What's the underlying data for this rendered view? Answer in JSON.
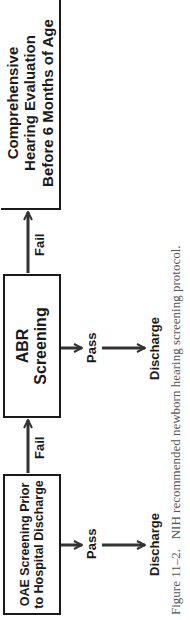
{
  "diagram": {
    "boxes": {
      "oae": {
        "line1": "OAE Screening Prior",
        "line2": "to Hospital Discharge"
      },
      "abr": {
        "line1": "ABR",
        "line2": "Screening"
      },
      "comprehensive": {
        "line1": "Comprehensive",
        "line2": "Hearing Evaluation",
        "line3": "Before 6 Months of Age"
      }
    },
    "edges": {
      "oae_fail": "Fail",
      "abr_fail": "Fail",
      "oae_pass": "Pass",
      "abr_pass": "Pass"
    },
    "outcomes": {
      "oae_discharge": "Discharge",
      "abr_discharge": "Discharge"
    }
  },
  "caption": {
    "number": "Figure 11–2.",
    "text": "NIH recommended newborn hearing screening protocol."
  }
}
